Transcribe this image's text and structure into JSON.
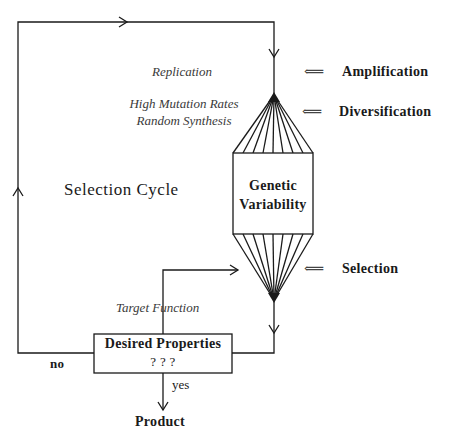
{
  "diagram": {
    "title": "Selection Cycle",
    "process_labels": {
      "replication": "Replication",
      "mutation_line1": "High Mutation Rates",
      "mutation_line2": "Random Synthesis",
      "target_function": "Target Function"
    },
    "stage_labels": {
      "amplification": "Amplification",
      "diversification": "Diversification",
      "selection": "Selection"
    },
    "stage_arrow_glyph": "⟸",
    "variability_box": {
      "line1": "Genetic",
      "line2": "Variability"
    },
    "decision_box": {
      "line1": "Desired Properties",
      "line2": "? ? ?"
    },
    "branches": {
      "no": "no",
      "yes": "yes"
    },
    "output": "Product",
    "fan_line_count": 9,
    "colors": {
      "line": "#1a1a1a",
      "italic_text": "#3a3a3a",
      "background": "#ffffff"
    }
  }
}
